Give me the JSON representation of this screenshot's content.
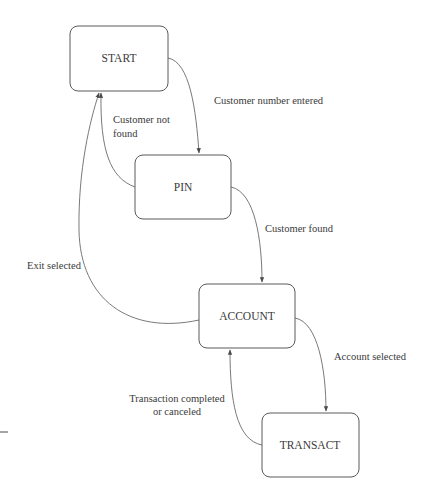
{
  "diagram": {
    "type": "state-diagram",
    "states": [
      {
        "id": "start",
        "label": "START"
      },
      {
        "id": "pin",
        "label": "PIN"
      },
      {
        "id": "account",
        "label": "ACCOUNT"
      },
      {
        "id": "transact",
        "label": "TRANSACT"
      }
    ],
    "transitions": [
      {
        "from": "START",
        "to": "PIN",
        "label": "Customer number entered"
      },
      {
        "from": "PIN",
        "to": "START",
        "label_line1": "Customer not",
        "label_line2": "found"
      },
      {
        "from": "PIN",
        "to": "ACCOUNT",
        "label": "Customer found"
      },
      {
        "from": "ACCOUNT",
        "to": "START",
        "label": "Exit selected"
      },
      {
        "from": "ACCOUNT",
        "to": "TRANSACT",
        "label": "Account selected"
      },
      {
        "from": "TRANSACT",
        "to": "ACCOUNT",
        "label_line1": "Transaction completed",
        "label_line2": "or canceled"
      }
    ],
    "colors": {
      "stroke": "#5a5a5a",
      "text": "#3a3a3a",
      "background": "#ffffff"
    }
  }
}
